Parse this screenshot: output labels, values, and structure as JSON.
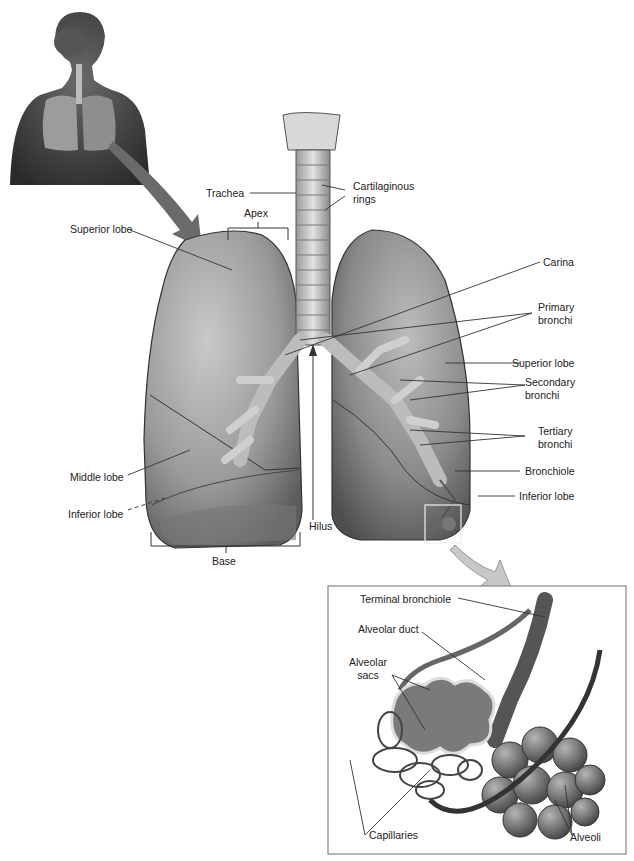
{
  "figure": {
    "colors": {
      "lung": "#9a9a9a",
      "lung_dark": "#5c5c5c",
      "airway": "#cfcfcf",
      "leader_line": "#333333",
      "inset_border": "#888888"
    }
  },
  "labels": {
    "trachea": "Trachea",
    "cartilaginous_rings_1": "Cartilaginous",
    "cartilaginous_rings_2": "rings",
    "apex": "Apex",
    "superior_lobe_left": "Superior lobe",
    "carina": "Carina",
    "primary_bronchi_1": "Primary",
    "primary_bronchi_2": "bronchi",
    "superior_lobe_right": "Superior lobe",
    "secondary_bronchi_1": "Secondary",
    "secondary_bronchi_2": "bronchi",
    "tertiary_bronchi_1": "Tertiary",
    "tertiary_bronchi_2": "bronchi",
    "bronchiole": "Bronchiole",
    "inferior_lobe_right": "Inferior lobe",
    "middle_lobe": "Middle lobe",
    "inferior_lobe_left": "Inferior lobe",
    "hilus": "Hilus",
    "base": "Base"
  },
  "inset": {
    "terminal_bronchiole": "Terminal bronchiole",
    "alveolar_duct": "Alveolar duct",
    "alveolar_sacs_1": "Alveolar",
    "alveolar_sacs_2": "sacs",
    "capillaries": "Capillaries",
    "alveoli": "Alveoli"
  }
}
